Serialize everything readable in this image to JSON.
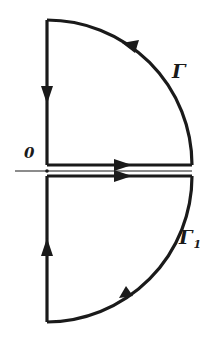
{
  "diagram": {
    "colors": {
      "stroke": "#1a1a1a",
      "background": "#ffffff"
    },
    "labels": {
      "origin": "0",
      "upper_contour": "Γ",
      "lower_contour_base": "Γ",
      "lower_contour_sub": "1"
    },
    "contours": [
      {
        "name": "Γ",
        "path": "upper quarter circle",
        "segments": [
          "real axis from 0 to R (upper edge, rightward)",
          "arc from R to iR (counter-clockwise)",
          "imaginary axis from iR down to 0"
        ],
        "arrows": [
          "right on real axis",
          "up-left on arc",
          "down on imaginary axis"
        ]
      },
      {
        "name": "Γ1",
        "path": "lower quarter circle",
        "segments": [
          "real axis from 0 to R (lower edge, rightward)",
          "arc from R to -iR (clockwise)",
          "imaginary axis from -iR up to 0"
        ],
        "arrows": [
          "right on real axis",
          "down-left on arc",
          "up on imaginary axis"
        ]
      }
    ]
  }
}
